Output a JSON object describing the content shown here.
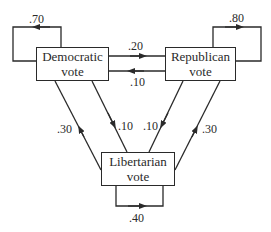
{
  "nodes": {
    "democratic": {
      "line1": "Democratic",
      "line2": "vote"
    },
    "republican": {
      "line1": "Republican",
      "line2": "vote"
    },
    "libertarian": {
      "line1": "Libertarian",
      "line2": "vote"
    }
  },
  "edges": {
    "dem_dem": ".70",
    "rep_rep": ".80",
    "lib_lib": ".40",
    "dem_rep": ".20",
    "rep_dem": ".10",
    "lib_dem": ".30",
    "dem_lib": ".10",
    "rep_lib": ".10",
    "lib_rep": ".30"
  },
  "colors": {
    "stroke": "#2a2a2a",
    "background": "#ffffff"
  }
}
